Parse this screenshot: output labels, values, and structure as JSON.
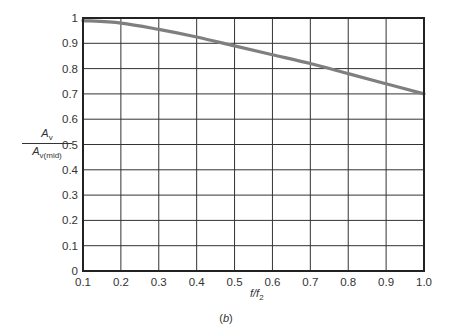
{
  "chart_data": {
    "type": "line",
    "title": "",
    "caption": "(b)",
    "xlabel": "f/f2",
    "ylabel": "Av / Av(mid)",
    "xlim": [
      0.1,
      1.0
    ],
    "ylim": [
      0,
      1
    ],
    "grid": true,
    "x_ticks": [
      "0.1",
      "0.2",
      "0.3",
      "0.4",
      "0.5",
      "0.6",
      "0.7",
      "0.8",
      "0.9",
      "1.0"
    ],
    "y_ticks": [
      "0",
      "0.1",
      "0.2",
      "0.3",
      "0.4",
      "0.5",
      "0.6",
      "0.7",
      "0.8",
      "0.9",
      "1"
    ],
    "series": [
      {
        "name": "Av/Av(mid)",
        "color": "#7f7f7f",
        "x": [
          0.1,
          0.2,
          0.3,
          0.4,
          0.5,
          0.6,
          0.7,
          0.8,
          0.9,
          1.0
        ],
        "values": [
          0.99,
          0.98,
          0.955,
          0.925,
          0.89,
          0.855,
          0.82,
          0.78,
          0.74,
          0.7
        ]
      }
    ]
  },
  "labels": {
    "y_num": "A",
    "y_num_sub": "v",
    "y_den": "A",
    "y_den_sub": "v(mid)",
    "x_main": "f/f",
    "x_sub": "2",
    "caption_open": "(",
    "caption_letter": "b",
    "caption_close": ")"
  }
}
